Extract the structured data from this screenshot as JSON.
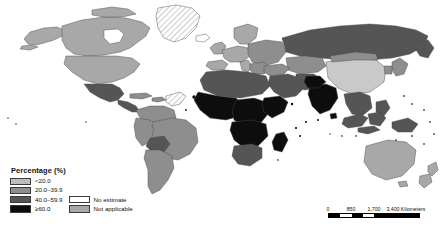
{
  "map": {
    "title": "",
    "projection": "world",
    "background_color": "#ffffff",
    "country_border_color": "#4a4a4a",
    "palette": {
      "lt20": "#c9c9c9",
      "r20_39": "#8e8e8e",
      "r40_59": "#555555",
      "ge60": "#0d0d0d",
      "no_estimate": "#ffffff",
      "not_applicable": "#a8a8a8"
    }
  },
  "legend": {
    "title": "Percentage (%)",
    "classes": [
      {
        "label": "<20.0",
        "color": "#c9c9c9",
        "key": "lt20"
      },
      {
        "label": "20.0–39.9",
        "color": "#8e8e8e",
        "key": "r20_39"
      },
      {
        "label": "40.0–59.9",
        "color": "#555555",
        "key": "r40_59"
      },
      {
        "label": "≥60.0",
        "color": "#0d0d0d",
        "key": "ge60"
      }
    ],
    "extra": [
      {
        "label": "No estimate",
        "color": "#ffffff",
        "key": "no_estimate"
      },
      {
        "label": "Not applicable",
        "color": "#a8a8a8",
        "key": "not_applicable"
      }
    ]
  },
  "scalebar": {
    "ticks": [
      "0",
      "850",
      "1,700",
      "3,400 Kilometers"
    ],
    "segments": [
      "dark",
      "light",
      "dark",
      "light",
      "dark"
    ]
  },
  "regions": [
    {
      "name": "Canada",
      "class": "not_applicable"
    },
    {
      "name": "United States",
      "class": "not_applicable"
    },
    {
      "name": "Greenland",
      "class": "no_estimate"
    },
    {
      "name": "Mexico",
      "class": "r40_59"
    },
    {
      "name": "Central America",
      "class": "r40_59"
    },
    {
      "name": "Caribbean",
      "class": "r20_39"
    },
    {
      "name": "Brazil",
      "class": "r20_39"
    },
    {
      "name": "Bolivia",
      "class": "r40_59"
    },
    {
      "name": "Argentina",
      "class": "r20_39"
    },
    {
      "name": "Western Europe",
      "class": "not_applicable"
    },
    {
      "name": "Eastern Europe",
      "class": "r20_39"
    },
    {
      "name": "Russian Federation",
      "class": "r40_59"
    },
    {
      "name": "North Africa",
      "class": "r40_59"
    },
    {
      "name": "West Africa",
      "class": "ge60"
    },
    {
      "name": "Central Africa",
      "class": "ge60"
    },
    {
      "name": "East Africa",
      "class": "ge60"
    },
    {
      "name": "Southern Africa",
      "class": "r40_59"
    },
    {
      "name": "Middle East",
      "class": "r40_59"
    },
    {
      "name": "India",
      "class": "ge60"
    },
    {
      "name": "China",
      "class": "lt20"
    },
    {
      "name": "Mongolia",
      "class": "r20_39"
    },
    {
      "name": "Southeast Asia",
      "class": "r40_59"
    },
    {
      "name": "Indonesia",
      "class": "r40_59"
    },
    {
      "name": "Australia",
      "class": "not_applicable"
    },
    {
      "name": "New Zealand",
      "class": "not_applicable"
    }
  ]
}
